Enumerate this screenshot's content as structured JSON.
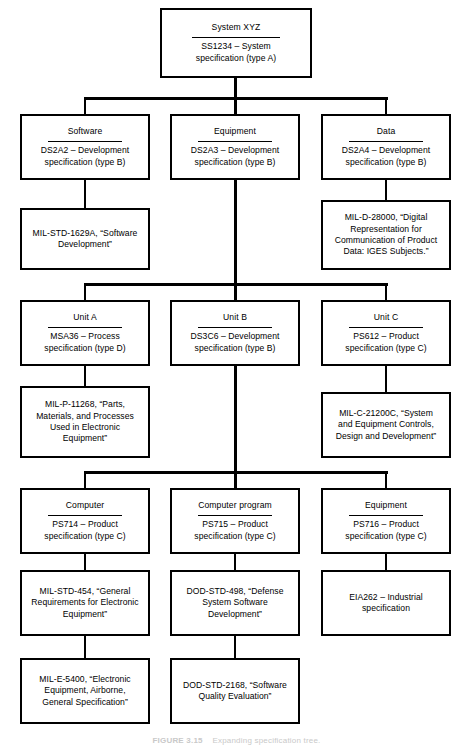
{
  "figure": {
    "caption_label": "FIGURE 3.15",
    "caption_text": "Expanding specification tree."
  },
  "diagram": {
    "type": "specification-tree",
    "orientation": "top-down",
    "levels": 4,
    "nodes": {
      "system": {
        "title": "System XYZ",
        "spec_line1": "SS1234 – System",
        "spec_line2": "specification (type A)"
      },
      "software": {
        "title": "Software",
        "spec_line1": "DS2A2 – Development",
        "spec_line2": "specification (type B)"
      },
      "equipment_l2": {
        "title": "Equipment",
        "spec_line1": "DS2A3 – Development",
        "spec_line2": "specification (type B)"
      },
      "data": {
        "title": "Data",
        "spec_line1": "DS2A4 – Development",
        "spec_line2": "specification (type B)"
      },
      "mil_std_1629a": {
        "line1": "MIL-STD-1629A, “Software",
        "line2": "Development”"
      },
      "mil_d_28000": {
        "line1": "MIL-D-28000, “Digital",
        "line2": "Representation for",
        "line3": "Communication of Product",
        "line4": "Data: IGES Subjects.”"
      },
      "unit_a": {
        "title": "Unit A",
        "spec_line1": "MSA36 – Process",
        "spec_line2": "specification (type D)"
      },
      "unit_b": {
        "title": "Unit B",
        "spec_line1": "DS3C6 – Development",
        "spec_line2": "specification (type B)"
      },
      "unit_c": {
        "title": "Unit C",
        "spec_line1": "PS612 – Product",
        "spec_line2": "specification (type C)"
      },
      "mil_p_11268": {
        "line1": "MIL-P-11268, “Parts,",
        "line2": "Materials, and Processes",
        "line3": "Used in Electronic",
        "line4": "Equipment”"
      },
      "mil_c_21200c": {
        "line1": "MIL-C-21200C, “System",
        "line2": "and Equipment Controls,",
        "line3": "Design and Development”"
      },
      "computer": {
        "title": "Computer",
        "spec_line1": "PS714 – Product",
        "spec_line2": "specification (type C)"
      },
      "computer_program": {
        "title": "Computer program",
        "spec_line1": "PS715 – Product",
        "spec_line2": "specification (type C)"
      },
      "equipment_l4": {
        "title": "Equipment",
        "spec_line1": "PS716 – Product",
        "spec_line2": "specification (type C)"
      },
      "mil_std_454": {
        "line1": "MIL-STD-454, “General",
        "line2": "Requirements for Electronic",
        "line3": "Equipment”"
      },
      "dod_std_498": {
        "line1": "DOD-STD-498, “Defense",
        "line2": "System Software",
        "line3": "Development”"
      },
      "eia262": {
        "line1": "EIA262 – Industrial",
        "line2": "specification"
      },
      "mil_e_5400": {
        "line1": "MIL-E-5400, “Electronic",
        "line2": "Equipment, Airborne,",
        "line3": "General Specification”"
      },
      "dod_std_2168": {
        "line1": "DOD-STD-2168, “Software",
        "line2": "Quality Evaluation”"
      }
    },
    "colors": {
      "stroke": "#000000",
      "background": "#ffffff",
      "text": "#000000"
    }
  }
}
